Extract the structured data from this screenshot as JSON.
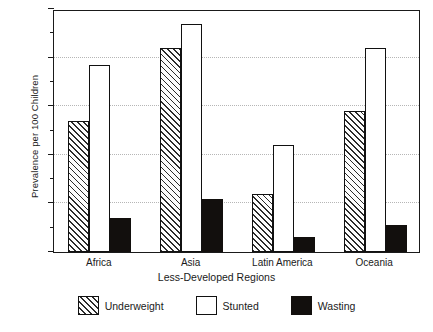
{
  "chart_data": {
    "type": "bar",
    "title": "",
    "xlabel": "Less-Developed Regions",
    "ylabel": "Prevalence per 100 Children",
    "categories": [
      "Africa",
      "Asia",
      "Latin America",
      "Oceania"
    ],
    "series": [
      {
        "name": "Underweight",
        "values": [
          27,
          42,
          12,
          29
        ],
        "style": "diagonal-hatch"
      },
      {
        "name": "Stunted",
        "values": [
          38.5,
          47,
          22,
          42
        ],
        "style": "open-white"
      },
      {
        "name": "Wasting",
        "values": [
          7,
          11,
          3,
          5.5
        ],
        "style": "solid-black"
      }
    ],
    "ylim": [
      0,
      50
    ],
    "ymajor_ticks": [
      0,
      10,
      20,
      30,
      40,
      50
    ],
    "yminor_ticks": [
      5,
      15,
      25,
      35,
      45
    ],
    "ytick_labels": [
      "0",
      "10",
      "20",
      "30",
      "40",
      "50"
    ],
    "grid": "horizontal-dotted-at-major",
    "legend_position": "below-axes",
    "colors": {
      "axis": "#1a1a1a",
      "gridline": "#b6b6b6",
      "bar_outline": "#111111",
      "wasting_fill": "#120f0d",
      "stunted_fill": "#ffffff",
      "background": "#ffffff"
    }
  },
  "legend": {
    "items": [
      {
        "label": "Underweight"
      },
      {
        "label": "Stunted"
      },
      {
        "label": "Wasting"
      }
    ]
  }
}
